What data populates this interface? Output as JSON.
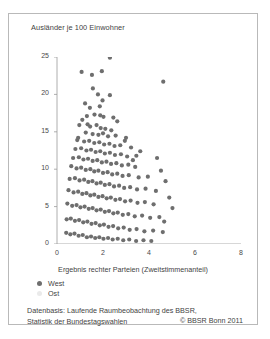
{
  "figure": {
    "y_axis_title": "Ausländer je 100 Einwohner",
    "x_axis_title": "Ergebnis rechter Parteien (Zweitstimmenanteil)"
  },
  "legend": {
    "west_label": "West",
    "ost_label": "Ost",
    "west_color": "#6e6e6e",
    "ost_color": "#eaeaea"
  },
  "footer": {
    "source_line1": "Datenbasis: Laufende Raumbeobachtung des BBSR,",
    "source_line2": "Statistik der Bundestagswahlen",
    "copyright": "© BBSR Bonn 2011"
  },
  "chart_data": {
    "type": "scatter",
    "title": "",
    "xlabel": "Ergebnis rechter Parteien (Zweitstimmenanteil)",
    "ylabel": "Ausländer je 100 Einwohner",
    "xlim": [
      0,
      8
    ],
    "ylim": [
      0,
      25
    ],
    "xticks": [
      0,
      2,
      4,
      6,
      8
    ],
    "yticks": [
      0,
      5,
      10,
      15,
      20,
      25
    ],
    "grid": false,
    "legend_position": "below-axis-left",
    "marker_color": "#6e6e6e",
    "marker_size_px": 2.1,
    "series": [
      {
        "name": "West",
        "color": "#6e6e6e",
        "points": [
          [
            2.3,
            24.9
          ],
          [
            1.07,
            23.0
          ],
          [
            1.52,
            22.6
          ],
          [
            1.95,
            23.1
          ],
          [
            4.62,
            21.7
          ],
          [
            1.56,
            20.8
          ],
          [
            1.78,
            20.0
          ],
          [
            2.3,
            19.9
          ],
          [
            1.43,
            18.2
          ],
          [
            1.86,
            18.4
          ],
          [
            1.3,
            17.1
          ],
          [
            1.63,
            17.3
          ],
          [
            1.88,
            17.2
          ],
          [
            2.02,
            17.0
          ],
          [
            1.1,
            16.6
          ],
          [
            2.62,
            16.4
          ],
          [
            0.97,
            15.9
          ],
          [
            1.44,
            15.7
          ],
          [
            1.72,
            15.9
          ],
          [
            1.9,
            15.5
          ],
          [
            2.1,
            15.4
          ],
          [
            2.36,
            15.2
          ],
          [
            1.25,
            14.9
          ],
          [
            1.55,
            14.7
          ],
          [
            1.8,
            14.6
          ],
          [
            2.0,
            14.8
          ],
          [
            2.22,
            14.4
          ],
          [
            2.55,
            14.5
          ],
          [
            3.0,
            14.2
          ],
          [
            0.88,
            13.9
          ],
          [
            1.18,
            13.7
          ],
          [
            1.4,
            13.8
          ],
          [
            1.62,
            13.5
          ],
          [
            1.84,
            13.6
          ],
          [
            2.05,
            13.3
          ],
          [
            2.28,
            13.4
          ],
          [
            2.5,
            13.1
          ],
          [
            2.75,
            13.2
          ],
          [
            3.22,
            12.9
          ],
          [
            0.8,
            12.7
          ],
          [
            1.05,
            12.8
          ],
          [
            1.28,
            12.5
          ],
          [
            1.48,
            12.6
          ],
          [
            1.68,
            12.3
          ],
          [
            1.88,
            12.4
          ],
          [
            2.08,
            12.1
          ],
          [
            2.3,
            12.2
          ],
          [
            2.52,
            11.9
          ],
          [
            2.78,
            12.0
          ],
          [
            3.05,
            11.7
          ],
          [
            3.45,
            11.8
          ],
          [
            0.7,
            11.5
          ],
          [
            0.95,
            11.6
          ],
          [
            1.15,
            11.3
          ],
          [
            1.35,
            11.4
          ],
          [
            1.55,
            11.1
          ],
          [
            1.75,
            11.2
          ],
          [
            1.95,
            10.9
          ],
          [
            2.15,
            11.0
          ],
          [
            2.35,
            10.7
          ],
          [
            2.58,
            10.8
          ],
          [
            2.82,
            10.5
          ],
          [
            3.1,
            10.6
          ],
          [
            3.4,
            10.3
          ],
          [
            0.62,
            10.4
          ],
          [
            0.85,
            10.1
          ],
          [
            1.05,
            10.2
          ],
          [
            1.25,
            9.9
          ],
          [
            1.45,
            10.0
          ],
          [
            1.62,
            9.7
          ],
          [
            1.8,
            9.8
          ],
          [
            2.0,
            9.5
          ],
          [
            2.2,
            9.6
          ],
          [
            2.4,
            9.3
          ],
          [
            2.62,
            9.4
          ],
          [
            2.85,
            9.1
          ],
          [
            3.12,
            9.2
          ],
          [
            3.55,
            8.9
          ],
          [
            3.95,
            9.0
          ],
          [
            0.55,
            8.7
          ],
          [
            0.78,
            8.8
          ],
          [
            0.98,
            8.5
          ],
          [
            1.18,
            8.6
          ],
          [
            1.36,
            8.3
          ],
          [
            1.54,
            8.4
          ],
          [
            1.72,
            8.1
          ],
          [
            1.9,
            8.2
          ],
          [
            2.08,
            7.9
          ],
          [
            2.28,
            8.0
          ],
          [
            2.48,
            7.7
          ],
          [
            2.7,
            7.8
          ],
          [
            2.92,
            7.5
          ],
          [
            3.18,
            7.6
          ],
          [
            3.48,
            7.3
          ],
          [
            3.85,
            7.4
          ],
          [
            4.3,
            7.1
          ],
          [
            0.5,
            7.2
          ],
          [
            0.72,
            6.9
          ],
          [
            0.92,
            7.0
          ],
          [
            1.1,
            6.7
          ],
          [
            1.28,
            6.8
          ],
          [
            1.45,
            6.5
          ],
          [
            1.62,
            6.6
          ],
          [
            1.8,
            6.3
          ],
          [
            1.98,
            6.4
          ],
          [
            2.16,
            6.1
          ],
          [
            2.34,
            6.2
          ],
          [
            2.54,
            5.9
          ],
          [
            2.74,
            6.0
          ],
          [
            2.96,
            5.7
          ],
          [
            3.2,
            5.8
          ],
          [
            3.5,
            5.5
          ],
          [
            3.82,
            5.6
          ],
          [
            4.2,
            5.3
          ],
          [
            0.45,
            5.4
          ],
          [
            0.66,
            5.1
          ],
          [
            0.85,
            5.2
          ],
          [
            1.02,
            4.9
          ],
          [
            1.2,
            5.0
          ],
          [
            1.38,
            4.7
          ],
          [
            1.55,
            4.8
          ],
          [
            1.72,
            4.5
          ],
          [
            1.9,
            4.6
          ],
          [
            2.08,
            4.3
          ],
          [
            2.26,
            4.4
          ],
          [
            2.45,
            4.1
          ],
          [
            2.64,
            4.2
          ],
          [
            2.86,
            3.9
          ],
          [
            3.1,
            4.0
          ],
          [
            3.38,
            3.7
          ],
          [
            3.7,
            3.8
          ],
          [
            4.05,
            3.5
          ],
          [
            4.45,
            3.6
          ],
          [
            0.42,
            3.3
          ],
          [
            0.6,
            3.4
          ],
          [
            0.78,
            3.1
          ],
          [
            0.96,
            3.2
          ],
          [
            1.14,
            2.9
          ],
          [
            1.32,
            3.0
          ],
          [
            1.5,
            2.7
          ],
          [
            1.68,
            2.8
          ],
          [
            1.86,
            2.5
          ],
          [
            2.04,
            2.6
          ],
          [
            2.24,
            2.3
          ],
          [
            2.44,
            2.4
          ],
          [
            2.66,
            2.1
          ],
          [
            2.9,
            2.2
          ],
          [
            3.16,
            1.9
          ],
          [
            3.46,
            2.0
          ],
          [
            3.8,
            1.7
          ],
          [
            4.18,
            1.8
          ],
          [
            4.6,
            1.6
          ],
          [
            0.4,
            1.5
          ],
          [
            0.58,
            1.3
          ],
          [
            0.76,
            1.4
          ],
          [
            0.94,
            1.1
          ],
          [
            1.12,
            1.2
          ],
          [
            1.3,
            0.9
          ],
          [
            1.48,
            1.0
          ],
          [
            1.66,
            0.8
          ],
          [
            1.84,
            0.9
          ],
          [
            2.02,
            0.7
          ],
          [
            2.22,
            0.8
          ],
          [
            2.42,
            0.6
          ],
          [
            2.64,
            0.7
          ],
          [
            2.88,
            0.5
          ],
          [
            3.14,
            0.6
          ],
          [
            3.44,
            0.4
          ],
          [
            3.76,
            0.5
          ],
          [
            4.1,
            0.4
          ],
          [
            1.33,
            16.0
          ],
          [
            2.45,
            16.9
          ],
          [
            0.92,
            14.2
          ],
          [
            3.62,
            12.4
          ],
          [
            3.3,
            11.2
          ],
          [
            2.95,
            13.8
          ],
          [
            4.72,
            8.4
          ],
          [
            4.52,
            9.8
          ],
          [
            4.35,
            11.5
          ],
          [
            4.88,
            6.2
          ],
          [
            5.02,
            4.8
          ],
          [
            4.66,
            3.0
          ],
          [
            1.98,
            19.2
          ],
          [
            1.22,
            18.8
          ]
        ]
      },
      {
        "name": "Ost",
        "color": "#eaeaea",
        "points": []
      }
    ]
  }
}
